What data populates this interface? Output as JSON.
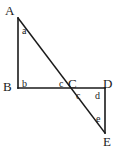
{
  "figure": {
    "stroke_color": "#1a1a1a",
    "label_color": "#1a1a1a",
    "background_color": "#ffffff",
    "stroke_width": 1.6,
    "vertices": [
      {
        "id": "A",
        "label": "A",
        "x": 18,
        "y": 18,
        "label_x": 5,
        "label_y": 4
      },
      {
        "id": "B",
        "label": "B",
        "x": 18,
        "y": 88,
        "label_x": 3,
        "label_y": 80
      },
      {
        "id": "C",
        "label": "C",
        "x": 72,
        "y": 88,
        "label_x": 68,
        "label_y": 77
      },
      {
        "id": "D",
        "label": "D",
        "x": 105,
        "y": 88,
        "label_x": 103,
        "label_y": 77
      },
      {
        "id": "E",
        "label": "E",
        "x": 105,
        "y": 133,
        "label_x": 103,
        "label_y": 135
      }
    ],
    "segments": [
      {
        "id": "AB",
        "from": "A",
        "to": "B",
        "x1": 18,
        "y1": 18,
        "x2": 18,
        "y2": 88
      },
      {
        "id": "BD",
        "from": "B",
        "to": "D",
        "x1": 18,
        "y1": 88,
        "x2": 105,
        "y2": 88
      },
      {
        "id": "AE",
        "from": "A",
        "to": "E",
        "x1": 18,
        "y1": 18,
        "x2": 105,
        "y2": 133
      },
      {
        "id": "DE",
        "from": "D",
        "to": "E",
        "x1": 105,
        "y1": 88,
        "x2": 105,
        "y2": 133
      }
    ],
    "angle_labels": [
      {
        "id": "a",
        "label": "a",
        "at_vertex": "A",
        "x": 22,
        "y": 26
      },
      {
        "id": "b",
        "label": "b",
        "at_vertex": "B",
        "x": 22,
        "y": 79
      },
      {
        "id": "c1",
        "label": "c",
        "at_vertex": "C",
        "x": 59,
        "y": 79
      },
      {
        "id": "c2",
        "label": "c",
        "at_vertex": "C",
        "x": 76,
        "y": 91
      },
      {
        "id": "d",
        "label": "d",
        "at_vertex": "D",
        "x": 95,
        "y": 91
      },
      {
        "id": "e",
        "label": "e",
        "at_vertex": "E",
        "x": 96,
        "y": 114
      }
    ]
  }
}
